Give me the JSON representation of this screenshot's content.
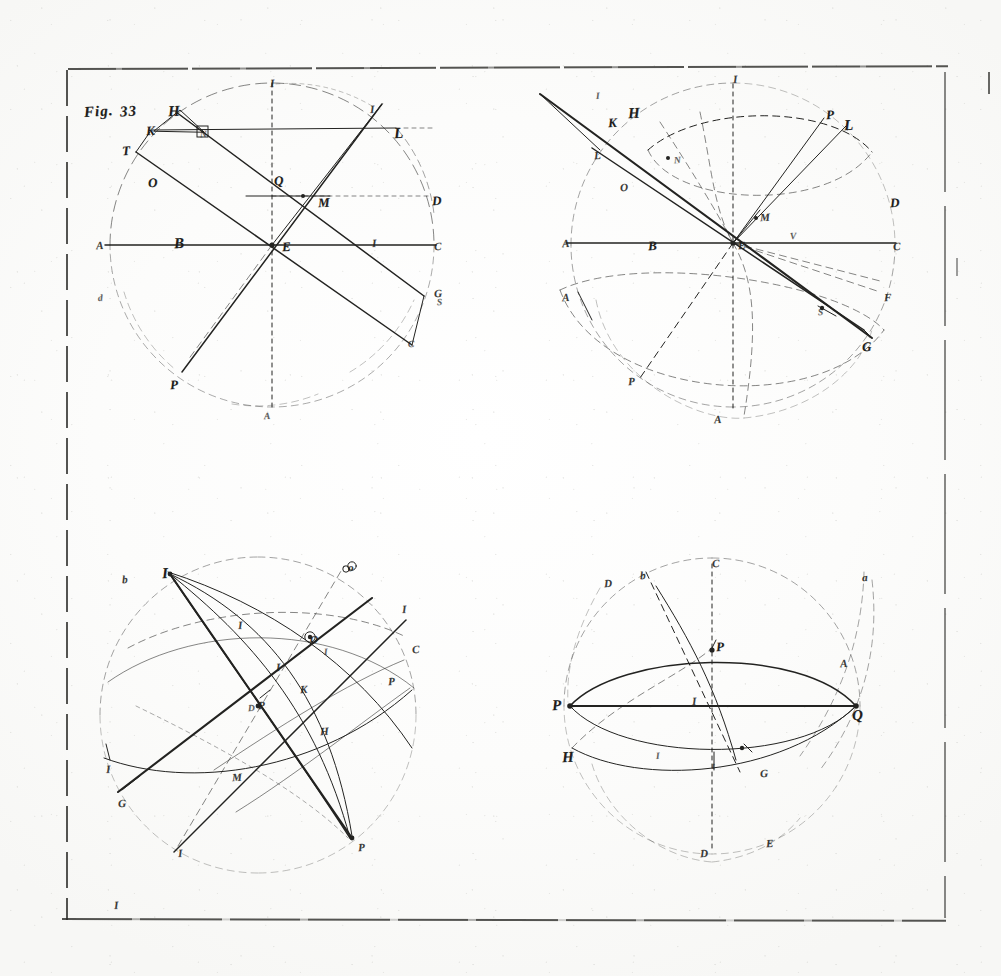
{
  "plate": {
    "kind": "engraved-plate-scan",
    "figure_label": "Fig. 33",
    "medium_note": "",
    "ink_color": "#232321",
    "paper_color": "#fdfdfc",
    "frame": {
      "style": "hand-ruled broken rule border",
      "stray_mark_bottom_left": "I"
    }
  },
  "figures": [
    {
      "id": "fig-top-left",
      "caption": "Fig. 33",
      "labels": [
        {
          "text": "Fig.",
          "x": 84,
          "y": 104,
          "size": "fig"
        },
        {
          "text": "33",
          "x": 120,
          "y": 104,
          "size": "fig"
        },
        {
          "text": "H",
          "x": 168,
          "y": 104,
          "size": "big"
        },
        {
          "text": "K",
          "x": 146,
          "y": 124,
          "size": ""
        },
        {
          "text": "N",
          "x": 200,
          "y": 130,
          "size": "xs"
        },
        {
          "text": "T",
          "x": 122,
          "y": 144,
          "size": ""
        },
        {
          "text": "O",
          "x": 148,
          "y": 176,
          "size": ""
        },
        {
          "text": "I",
          "x": 270,
          "y": 78,
          "size": "sm"
        },
        {
          "text": "I",
          "x": 370,
          "y": 104,
          "size": "sm"
        },
        {
          "text": "L",
          "x": 394,
          "y": 126,
          "size": "big"
        },
        {
          "text": "D",
          "x": 432,
          "y": 194,
          "size": ""
        },
        {
          "text": "Q",
          "x": 274,
          "y": 174,
          "size": ""
        },
        {
          "text": "M",
          "x": 318,
          "y": 196,
          "size": ""
        },
        {
          "text": "A",
          "x": 96,
          "y": 240,
          "size": "sm"
        },
        {
          "text": "B",
          "x": 174,
          "y": 236,
          "size": "big"
        },
        {
          "text": "E",
          "x": 282,
          "y": 240,
          "size": ""
        },
        {
          "text": "I",
          "x": 372,
          "y": 238,
          "size": "sm"
        },
        {
          "text": "C",
          "x": 434,
          "y": 241,
          "size": "sm"
        },
        {
          "text": "G",
          "x": 434,
          "y": 288,
          "size": "sm"
        },
        {
          "text": "S",
          "x": 437,
          "y": 298,
          "size": "xs"
        },
        {
          "text": "d",
          "x": 98,
          "y": 294,
          "size": "xs"
        },
        {
          "text": "C",
          "x": 408,
          "y": 340,
          "size": "xs"
        },
        {
          "text": "P",
          "x": 170,
          "y": 378,
          "size": ""
        },
        {
          "text": "A",
          "x": 264,
          "y": 412,
          "size": "xs"
        }
      ]
    },
    {
      "id": "fig-top-right",
      "caption": "",
      "labels": [
        {
          "text": "I",
          "x": 596,
          "y": 92,
          "size": "xs"
        },
        {
          "text": "I",
          "x": 733,
          "y": 74,
          "size": "sm"
        },
        {
          "text": "K",
          "x": 608,
          "y": 116,
          "size": ""
        },
        {
          "text": "H",
          "x": 628,
          "y": 106,
          "size": "big"
        },
        {
          "text": "P",
          "x": 826,
          "y": 108,
          "size": ""
        },
        {
          "text": "L",
          "x": 844,
          "y": 118,
          "size": "big"
        },
        {
          "text": "L",
          "x": 594,
          "y": 150,
          "size": "sm"
        },
        {
          "text": "N",
          "x": 674,
          "y": 156,
          "size": "xs"
        },
        {
          "text": "O",
          "x": 620,
          "y": 182,
          "size": "sm"
        },
        {
          "text": "D",
          "x": 890,
          "y": 196,
          "size": ""
        },
        {
          "text": "M",
          "x": 760,
          "y": 212,
          "size": "sm"
        },
        {
          "text": "A",
          "x": 562,
          "y": 238,
          "size": "sm"
        },
        {
          "text": "B",
          "x": 648,
          "y": 239,
          "size": ""
        },
        {
          "text": "E",
          "x": 738,
          "y": 240,
          "size": "sm"
        },
        {
          "text": "C",
          "x": 893,
          "y": 241,
          "size": "sm"
        },
        {
          "text": "V",
          "x": 790,
          "y": 232,
          "size": "xs"
        },
        {
          "text": "A",
          "x": 562,
          "y": 292,
          "size": "sm"
        },
        {
          "text": "F",
          "x": 884,
          "y": 292,
          "size": "sm"
        },
        {
          "text": "S",
          "x": 818,
          "y": 308,
          "size": "xs"
        },
        {
          "text": "G",
          "x": 862,
          "y": 340,
          "size": ""
        },
        {
          "text": "P",
          "x": 628,
          "y": 376,
          "size": "sm"
        },
        {
          "text": "A",
          "x": 714,
          "y": 414,
          "size": "sm"
        }
      ]
    },
    {
      "id": "fig-bottom-left",
      "caption": "",
      "labels": [
        {
          "text": "b",
          "x": 122,
          "y": 574,
          "size": "sm"
        },
        {
          "text": "I",
          "x": 162,
          "y": 566,
          "size": "big"
        },
        {
          "text": "o",
          "x": 348,
          "y": 562,
          "size": "sm"
        },
        {
          "text": "I",
          "x": 238,
          "y": 620,
          "size": "sm"
        },
        {
          "text": "I",
          "x": 402,
          "y": 604,
          "size": "sm"
        },
        {
          "text": "O",
          "x": 310,
          "y": 634,
          "size": "sm"
        },
        {
          "text": "C",
          "x": 412,
          "y": 644,
          "size": "sm"
        },
        {
          "text": "I",
          "x": 276,
          "y": 662,
          "size": "sm"
        },
        {
          "text": "I",
          "x": 324,
          "y": 648,
          "size": "xs"
        },
        {
          "text": "K",
          "x": 300,
          "y": 684,
          "size": "sm"
        },
        {
          "text": "P",
          "x": 388,
          "y": 676,
          "size": "sm"
        },
        {
          "text": "P",
          "x": 258,
          "y": 700,
          "size": "sm"
        },
        {
          "text": "D",
          "x": 248,
          "y": 704,
          "size": "xs"
        },
        {
          "text": "H",
          "x": 320,
          "y": 726,
          "size": "sm"
        },
        {
          "text": "I",
          "x": 106,
          "y": 764,
          "size": "sm"
        },
        {
          "text": "M",
          "x": 232,
          "y": 772,
          "size": "sm"
        },
        {
          "text": "G",
          "x": 118,
          "y": 798,
          "size": "sm"
        },
        {
          "text": "I",
          "x": 178,
          "y": 848,
          "size": "sm"
        },
        {
          "text": "P",
          "x": 358,
          "y": 842,
          "size": "sm"
        }
      ]
    },
    {
      "id": "fig-bottom-right",
      "caption": "",
      "labels": [
        {
          "text": "C",
          "x": 712,
          "y": 558,
          "size": "sm"
        },
        {
          "text": "b",
          "x": 640,
          "y": 570,
          "size": "sm"
        },
        {
          "text": "D",
          "x": 604,
          "y": 578,
          "size": "sm"
        },
        {
          "text": "a",
          "x": 862,
          "y": 572,
          "size": "sm"
        },
        {
          "text": "P",
          "x": 716,
          "y": 640,
          "size": ""
        },
        {
          "text": "A",
          "x": 840,
          "y": 658,
          "size": "sm"
        },
        {
          "text": "I",
          "x": 692,
          "y": 696,
          "size": "sm"
        },
        {
          "text": "P",
          "x": 552,
          "y": 698,
          "size": "big"
        },
        {
          "text": "Q",
          "x": 852,
          "y": 708,
          "size": "big"
        },
        {
          "text": "H",
          "x": 562,
          "y": 750,
          "size": "big"
        },
        {
          "text": "I",
          "x": 656,
          "y": 752,
          "size": "xs"
        },
        {
          "text": "t",
          "x": 712,
          "y": 762,
          "size": "xs"
        },
        {
          "text": "G",
          "x": 760,
          "y": 768,
          "size": "sm"
        },
        {
          "text": "E",
          "x": 766,
          "y": 838,
          "size": "sm"
        },
        {
          "text": "D",
          "x": 700,
          "y": 848,
          "size": "sm"
        }
      ]
    }
  ],
  "stray_marks": [
    {
      "text": "I",
      "x": 114,
      "y": 900,
      "size": "sm"
    }
  ]
}
